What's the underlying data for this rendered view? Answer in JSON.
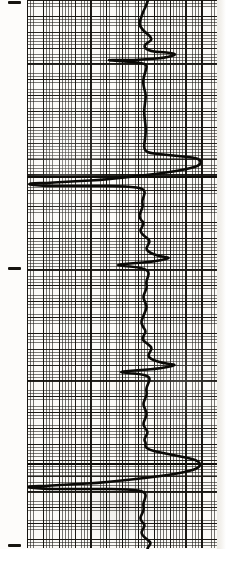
{
  "sheet": {
    "title": "Borehole geophysical log strip",
    "width": 226,
    "height": 566,
    "paper_color": "#fbfaf7",
    "ink_color": "#0b0a07",
    "grid_line_color": "#1e1c18",
    "grid_major_color": "#12100c"
  },
  "grid": {
    "left": 27,
    "top": 0,
    "right": 217,
    "bottom": 548,
    "fine_cell_px": 3.17,
    "major_every_cells": 5,
    "major_cell_px": 15.85,
    "label": "logarithmic-ruled log paper"
  },
  "depth_ticks": [
    {
      "name": "depth-tick-top",
      "y": 1,
      "x": 8,
      "length": 13
    },
    {
      "name": "depth-tick-middle",
      "y": 267,
      "x": 8,
      "length": 13
    },
    {
      "name": "depth-tick-bottom",
      "y": 544,
      "x": 8,
      "length": 13
    }
  ],
  "marker_lines": [
    {
      "name": "marker-line-upper",
      "y": 176,
      "x": 27,
      "width": 190
    },
    {
      "name": "marker-line-lower",
      "y": 463,
      "x": 27,
      "width": 190
    }
  ],
  "chart_data": {
    "type": "line",
    "subtitle": "single continuous trace on 5-division ruled log paper",
    "orientation": "vertical",
    "xlabel": "log response (deflection, grid divisions)",
    "ylabel": "depth (grid divisions, increasing downward)",
    "xlim": [
      27,
      217
    ],
    "ylim": [
      0,
      566
    ],
    "grid": true,
    "legend": false,
    "baseline_x": 146,
    "series": [
      {
        "name": "log-trace",
        "color": "#0b0a07",
        "stroke_width": 2.6,
        "comment": "points are (x = deflection in image px, y = depth in image px), ordered top to bottom",
        "points": [
          [
            148,
            0
          ],
          [
            146,
            6
          ],
          [
            143,
            12
          ],
          [
            141,
            18
          ],
          [
            139,
            24
          ],
          [
            142,
            29
          ],
          [
            146,
            33
          ],
          [
            150,
            36
          ],
          [
            152,
            40
          ],
          [
            147,
            43
          ],
          [
            144,
            46
          ],
          [
            146,
            49
          ],
          [
            151,
            51
          ],
          [
            157,
            52
          ],
          [
            163,
            52
          ],
          [
            170,
            53
          ],
          [
            176,
            54
          ],
          [
            172,
            56
          ],
          [
            163,
            58
          ],
          [
            150,
            59
          ],
          [
            134,
            60
          ],
          [
            118,
            60
          ],
          [
            106,
            60
          ],
          [
            118,
            61
          ],
          [
            132,
            62
          ],
          [
            142,
            63
          ],
          [
            147,
            65
          ],
          [
            146,
            70
          ],
          [
            144,
            76
          ],
          [
            143,
            82
          ],
          [
            144,
            88
          ],
          [
            146,
            95
          ],
          [
            145,
            103
          ],
          [
            144,
            112
          ],
          [
            145,
            121
          ],
          [
            146,
            130
          ],
          [
            145,
            139
          ],
          [
            144,
            146
          ],
          [
            145,
            151
          ],
          [
            150,
            153
          ],
          [
            158,
            154
          ],
          [
            168,
            155
          ],
          [
            178,
            156
          ],
          [
            188,
            157
          ],
          [
            196,
            158
          ],
          [
            200,
            160
          ],
          [
            201,
            163
          ],
          [
            198,
            166
          ],
          [
            191,
            168
          ],
          [
            182,
            170
          ],
          [
            170,
            172
          ],
          [
            155,
            174
          ],
          [
            138,
            176
          ],
          [
            120,
            178
          ],
          [
            100,
            180
          ],
          [
            80,
            181
          ],
          [
            62,
            182
          ],
          [
            46,
            183
          ],
          [
            34,
            183
          ],
          [
            28,
            184
          ],
          [
            33,
            185
          ],
          [
            46,
            186
          ],
          [
            62,
            186
          ],
          [
            80,
            186
          ],
          [
            100,
            186
          ],
          [
            118,
            186
          ],
          [
            132,
            187
          ],
          [
            141,
            188
          ],
          [
            145,
            191
          ],
          [
            144,
            196
          ],
          [
            142,
            201
          ],
          [
            143,
            206
          ],
          [
            141,
            211
          ],
          [
            139,
            216
          ],
          [
            141,
            220
          ],
          [
            144,
            223
          ],
          [
            142,
            227
          ],
          [
            140,
            231
          ],
          [
            143,
            235
          ],
          [
            147,
            238
          ],
          [
            150,
            241
          ],
          [
            148,
            245
          ],
          [
            146,
            249
          ],
          [
            149,
            252
          ],
          [
            153,
            254
          ],
          [
            159,
            256
          ],
          [
            165,
            257
          ],
          [
            170,
            258
          ],
          [
            162,
            260
          ],
          [
            150,
            262
          ],
          [
            136,
            263
          ],
          [
            124,
            264
          ],
          [
            116,
            265
          ],
          [
            124,
            266
          ],
          [
            136,
            267
          ],
          [
            145,
            269
          ],
          [
            149,
            272
          ],
          [
            148,
            277
          ],
          [
            146,
            282
          ],
          [
            147,
            287
          ],
          [
            145,
            292
          ],
          [
            143,
            297
          ],
          [
            145,
            302
          ],
          [
            147,
            307
          ],
          [
            145,
            312
          ],
          [
            143,
            317
          ],
          [
            141,
            322
          ],
          [
            143,
            327
          ],
          [
            146,
            331
          ],
          [
            144,
            335
          ],
          [
            142,
            339
          ],
          [
            145,
            342
          ],
          [
            149,
            345
          ],
          [
            152,
            348
          ],
          [
            150,
            352
          ],
          [
            148,
            356
          ],
          [
            151,
            359
          ],
          [
            156,
            361
          ],
          [
            163,
            363
          ],
          [
            170,
            364
          ],
          [
            176,
            365
          ],
          [
            168,
            367
          ],
          [
            155,
            369
          ],
          [
            141,
            370
          ],
          [
            128,
            371
          ],
          [
            119,
            372
          ],
          [
            128,
            373
          ],
          [
            140,
            374
          ],
          [
            148,
            376
          ],
          [
            150,
            379
          ],
          [
            148,
            384
          ],
          [
            146,
            389
          ],
          [
            147,
            394
          ],
          [
            145,
            399
          ],
          [
            143,
            404
          ],
          [
            145,
            409
          ],
          [
            147,
            414
          ],
          [
            145,
            419
          ],
          [
            143,
            424
          ],
          [
            145,
            428
          ],
          [
            148,
            432
          ],
          [
            146,
            436
          ],
          [
            144,
            440
          ],
          [
            146,
            443
          ],
          [
            145,
            447
          ],
          [
            150,
            450
          ],
          [
            158,
            452
          ],
          [
            168,
            454
          ],
          [
            178,
            456
          ],
          [
            188,
            458
          ],
          [
            196,
            460
          ],
          [
            200,
            463
          ],
          [
            200,
            466
          ],
          [
            196,
            469
          ],
          [
            189,
            471
          ],
          [
            180,
            473
          ],
          [
            168,
            475
          ],
          [
            153,
            477
          ],
          [
            136,
            479
          ],
          [
            117,
            481
          ],
          [
            97,
            483
          ],
          [
            78,
            484
          ],
          [
            60,
            485
          ],
          [
            44,
            486
          ],
          [
            33,
            486
          ],
          [
            27,
            487
          ],
          [
            33,
            488
          ],
          [
            47,
            489
          ],
          [
            64,
            489
          ],
          [
            83,
            489
          ],
          [
            103,
            489
          ],
          [
            120,
            489
          ],
          [
            134,
            490
          ],
          [
            142,
            491
          ],
          [
            146,
            494
          ],
          [
            145,
            499
          ],
          [
            143,
            504
          ],
          [
            144,
            509
          ],
          [
            142,
            514
          ],
          [
            140,
            518
          ],
          [
            142,
            522
          ],
          [
            145,
            525
          ],
          [
            143,
            529
          ],
          [
            141,
            533
          ],
          [
            144,
            537
          ],
          [
            148,
            540
          ],
          [
            151,
            543
          ],
          [
            149,
            546
          ],
          [
            147,
            549
          ],
          [
            150,
            551
          ],
          [
            155,
            553
          ],
          [
            161,
            554
          ],
          [
            168,
            555
          ],
          [
            173,
            556
          ],
          [
            164,
            558
          ],
          [
            151,
            559
          ],
          [
            137,
            560
          ],
          [
            125,
            561
          ],
          [
            117,
            561
          ],
          [
            126,
            562
          ],
          [
            138,
            563
          ],
          [
            146,
            564
          ],
          [
            148,
            566
          ]
        ]
      }
    ],
    "annotations": [
      {
        "name": "major-right-excursion-upper",
        "depth_y": 160,
        "note": "maximum right deflection"
      },
      {
        "name": "major-left-excursion-upper",
        "depth_y": 184,
        "note": "maximum left deflection, runs off track"
      },
      {
        "name": "major-right-excursion-lower",
        "depth_y": 462,
        "note": "maximum right deflection (repeat section)"
      },
      {
        "name": "major-left-excursion-lower",
        "depth_y": 487,
        "note": "maximum left deflection (repeat section)"
      }
    ]
  }
}
